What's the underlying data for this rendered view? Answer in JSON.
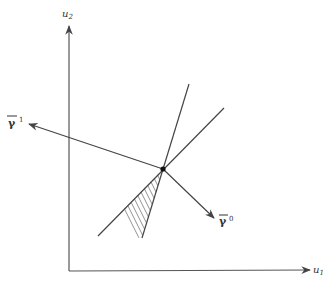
{
  "diagram": {
    "axes": {
      "x_label": "u",
      "x_sub": "1",
      "y_label": "u",
      "y_sub": "2"
    },
    "vectors": [
      {
        "name": "gamma-bar-1",
        "symbol": "γ",
        "superscript": "1"
      },
      {
        "name": "gamma-bar-0",
        "symbol": "γ",
        "superscript": "0"
      }
    ],
    "colors": {
      "line": "#444444",
      "axis": "#555555",
      "hatch": "#777777"
    }
  }
}
